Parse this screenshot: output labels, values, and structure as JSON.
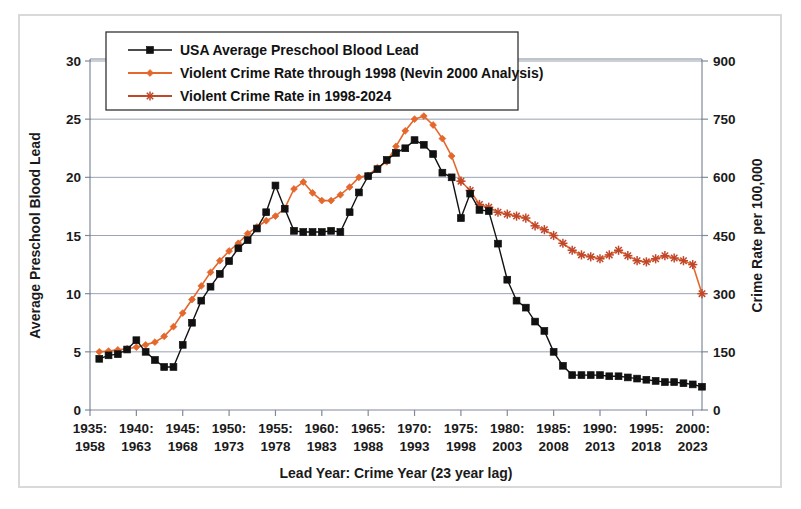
{
  "figure": {
    "background": "#ffffff",
    "border_color": "#d9d9d9"
  },
  "legend": {
    "position": "top-center-inside",
    "items": [
      {
        "label": "USA Average Preschool Blood Lead",
        "marker": "square",
        "color": "#111111"
      },
      {
        "label": "Violent Crime Rate through 1998 (Nevin 2000 Analysis)",
        "marker": "diamond",
        "color": "#E4682C"
      },
      {
        "label": "Violent Crime Rate in 1998-2024",
        "marker": "star",
        "color": "#C0472A"
      }
    ]
  },
  "chart_data": {
    "type": "line",
    "title": "",
    "xlabel": "Lead Year: Crime Year (23 year lag)",
    "ylabel": "Average Preschool Blood Lead",
    "ylabel_right": "Crime Rate per 100,000",
    "grid": true,
    "xlim": [
      1935,
      2001
    ],
    "ylim": [
      0,
      30
    ],
    "ylim_right": [
      0,
      900
    ],
    "yticks": [
      0,
      5,
      10,
      15,
      20,
      25,
      30
    ],
    "yticks_right": [
      0,
      150,
      300,
      450,
      600,
      750,
      900
    ],
    "xtick_labels_top": [
      "1935:",
      "1940:",
      "1945:",
      "1950:",
      "1955:",
      "1960:",
      "1965:",
      "1970:",
      "1975:",
      "1980:",
      "1985:",
      "1990:",
      "1995:",
      "2000:"
    ],
    "xtick_labels_bottom": [
      "1958",
      "1963",
      "1968",
      "1973",
      "1978",
      "1983",
      "1988",
      "1993",
      "1998",
      "2003",
      "2008",
      "2013",
      "2018",
      "2023"
    ],
    "xticks": [
      1935,
      1940,
      1945,
      1950,
      1955,
      1960,
      1965,
      1970,
      1975,
      1980,
      1985,
      1990,
      1995,
      2000
    ],
    "series": [
      {
        "name": "USA Average Preschool Blood Lead",
        "axis": "left",
        "color": "#111111",
        "marker": "square",
        "x": [
          1936,
          1937,
          1938,
          1939,
          1940,
          1941,
          1942,
          1943,
          1944,
          1945,
          1946,
          1947,
          1948,
          1949,
          1950,
          1951,
          1952,
          1953,
          1954,
          1955,
          1956,
          1957,
          1958,
          1959,
          1960,
          1961,
          1962,
          1963,
          1964,
          1965,
          1966,
          1967,
          1968,
          1969,
          1970,
          1971,
          1972,
          1973,
          1974,
          1975,
          1976,
          1977,
          1978,
          1979,
          1980,
          1981,
          1982,
          1983,
          1984,
          1985,
          1986,
          1987,
          1988,
          1989,
          1990,
          1991,
          1992,
          1993,
          1994,
          1995,
          1996,
          1997,
          1998,
          1999,
          2000,
          2001
        ],
        "y": [
          4.4,
          4.7,
          4.8,
          5.2,
          6.0,
          5.0,
          4.3,
          3.7,
          3.7,
          5.6,
          7.5,
          9.4,
          10.6,
          11.7,
          12.8,
          13.9,
          14.6,
          15.6,
          17.0,
          19.3,
          17.3,
          15.4,
          15.3,
          15.3,
          15.3,
          15.4,
          15.3,
          17.0,
          18.7,
          20.1,
          20.7,
          21.5,
          22.1,
          22.5,
          23.2,
          22.8,
          22.0,
          20.4,
          20.0,
          16.5,
          18.6,
          17.2,
          17.1,
          14.3,
          11.2,
          9.4,
          8.8,
          7.6,
          6.8,
          5.0,
          3.8,
          3.0,
          3.0,
          3.0,
          3.0,
          2.9,
          2.9,
          2.8,
          2.7,
          2.6,
          2.5,
          2.4,
          2.4,
          2.3,
          2.2,
          2.0
        ]
      },
      {
        "name": "Violent Crime Rate through 1998 (Nevin 2000 Analysis)",
        "axis": "right",
        "color": "#E4682C",
        "marker": "diamond",
        "x": [
          1936,
          1937,
          1938,
          1939,
          1940,
          1941,
          1942,
          1943,
          1944,
          1945,
          1946,
          1947,
          1948,
          1949,
          1950,
          1951,
          1952,
          1953,
          1954,
          1955,
          1956,
          1957,
          1958,
          1959,
          1960,
          1961,
          1962,
          1963,
          1964,
          1965,
          1966,
          1967,
          1968,
          1969,
          1970,
          1971,
          1972,
          1973,
          1974,
          1975
        ],
        "y": [
          150,
          152,
          155,
          158,
          162,
          168,
          175,
          190,
          215,
          250,
          285,
          320,
          355,
          385,
          410,
          430,
          455,
          472,
          488,
          500,
          520,
          570,
          588,
          560,
          540,
          540,
          555,
          575,
          600,
          605,
          625,
          640,
          680,
          720,
          750,
          758,
          735,
          700,
          655,
          590
        ]
      },
      {
        "name": "Violent Crime Rate in 1998-2024",
        "axis": "right",
        "color": "#C0472A",
        "marker": "star",
        "x": [
          1975,
          1976,
          1977,
          1978,
          1979,
          1980,
          1981,
          1982,
          1983,
          1984,
          1985,
          1986,
          1987,
          1988,
          1989,
          1990,
          1991,
          1992,
          1993,
          1994,
          1995,
          1996,
          1997,
          1998,
          1999,
          2000,
          2001
        ],
        "y": [
          590,
          566,
          530,
          523,
          510,
          505,
          500,
          495,
          475,
          465,
          450,
          430,
          412,
          400,
          395,
          390,
          400,
          412,
          398,
          385,
          382,
          390,
          398,
          392,
          385,
          375,
          300
        ]
      }
    ]
  }
}
